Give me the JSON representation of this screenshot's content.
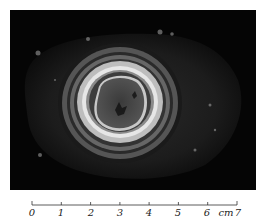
{
  "figure": {
    "background_color": "#050505"
  },
  "scale_bar": {
    "unit": "cm",
    "ticks": [
      "0",
      "1",
      "2",
      "3",
      "4",
      "5",
      "6",
      "7"
    ],
    "unit_label": "cm"
  }
}
